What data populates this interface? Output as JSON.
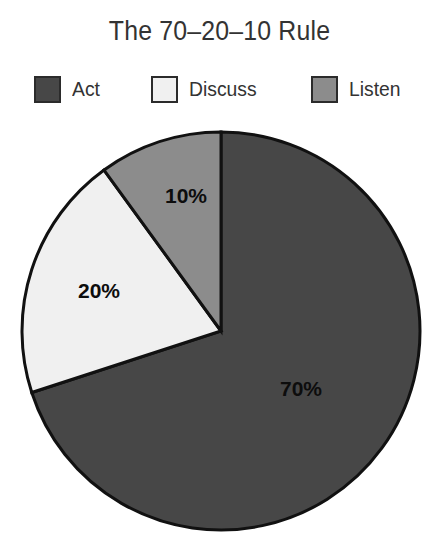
{
  "chart_data": {
    "type": "pie",
    "title": "The 70–20–10 Rule",
    "xlabel": "",
    "ylabel": "",
    "grid": false,
    "legend_position": "top",
    "start_angle_deg": 0,
    "direction": "clockwise",
    "center": {
      "x": 221,
      "y": 331
    },
    "radius": 199,
    "categories": [
      "Act",
      "Discuss",
      "Listen"
    ],
    "values": [
      70,
      20,
      10
    ],
    "labels": [
      "70%",
      "20%",
      "10%"
    ],
    "colors": [
      "#474747",
      "#f0f0f0",
      "#8c8c8c"
    ],
    "slices": [
      {
        "name": "Act",
        "value": 70,
        "label": "70%",
        "color": "#474747",
        "start_deg": 0,
        "end_deg": 252,
        "label_x": 301,
        "label_y": 390
      },
      {
        "name": "Discuss",
        "value": 20,
        "label": "20%",
        "color": "#f0f0f0",
        "start_deg": 252,
        "end_deg": 324,
        "label_x": 99,
        "label_y": 292
      },
      {
        "name": "Listen",
        "value": 10,
        "label": "10%",
        "color": "#8c8c8c",
        "start_deg": 324,
        "end_deg": 360,
        "label_x": 186,
        "label_y": 197
      }
    ],
    "outline_color": "#111111",
    "background": "#ffffff"
  },
  "title": {
    "text": "The 70–20–10 Rule"
  },
  "legend": {
    "items": [
      {
        "label": "Act",
        "color": "#474747"
      },
      {
        "label": "Discuss",
        "color": "#f0f0f0"
      },
      {
        "label": "Listen",
        "color": "#8c8c8c"
      }
    ]
  }
}
